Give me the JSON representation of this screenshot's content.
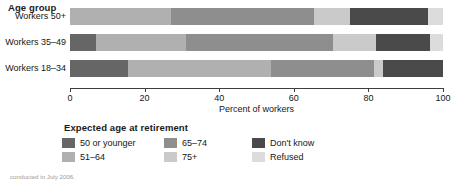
{
  "chart_data": {
    "type": "bar",
    "orientation": "horizontal",
    "stacked": true,
    "normalized_percent": true,
    "title": "",
    "group_header": "Age group",
    "xlabel": "Percent of workers",
    "ylabel": "",
    "xlim": [
      0,
      100
    ],
    "xticks": [
      0,
      20,
      40,
      60,
      80,
      100
    ],
    "xticklabels": [
      "0",
      "20",
      "40",
      "60",
      "80",
      "100"
    ],
    "grid": false,
    "legend_title": "Expected age at retirement",
    "legend_position": "below-left",
    "categories": [
      "Workers 50+",
      "Workers 35–49",
      "Workers 18–34"
    ],
    "series": [
      {
        "name": "50 or younger",
        "color": "#666666",
        "values": [
          0,
          7,
          15.5
        ]
      },
      {
        "name": "51–64",
        "color": "#b0b0b0",
        "values": [
          27,
          24,
          38.5
        ]
      },
      {
        "name": "65–74",
        "color": "#8e8e8e",
        "values": [
          38.5,
          39.5,
          27.5
        ]
      },
      {
        "name": "75+",
        "color": "#cacaca",
        "values": [
          9.5,
          11.5,
          2.5
        ]
      },
      {
        "name": "Don't know",
        "color": "#4a4a4a",
        "values": [
          21,
          14.5,
          16
        ]
      },
      {
        "name": "Refused",
        "color": "#dcdcdc",
        "values": [
          4,
          3.5,
          0
        ]
      }
    ]
  },
  "legend": {
    "title": "Expected age at retirement",
    "items": [
      {
        "label": "50 or younger",
        "color": "#666666"
      },
      {
        "label": "65–74",
        "color": "#8e8e8e"
      },
      {
        "label": "Don't know",
        "color": "#4a4a4a"
      },
      {
        "label": "51–64",
        "color": "#b0b0b0"
      },
      {
        "label": "75+",
        "color": "#cacaca"
      },
      {
        "label": "Refused",
        "color": "#dcdcdc"
      }
    ]
  },
  "footnote": "conducted in July 2006."
}
